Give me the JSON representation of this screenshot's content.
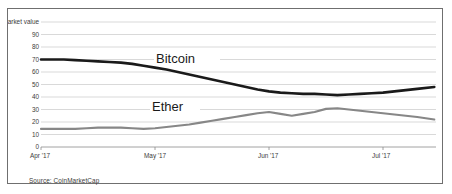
{
  "figure": {
    "source_note": "Source: CoinMarketCap"
  },
  "chart_data": {
    "type": "line",
    "title": "",
    "subtitle": "",
    "xlabel": "",
    "ylabel": "100% share of market value",
    "ylim": [
      0,
      100
    ],
    "yticks": [
      0,
      10,
      20,
      30,
      40,
      50,
      60,
      70,
      80,
      90
    ],
    "ytick_labels": [
      "0",
      "10",
      "20",
      "30",
      "40",
      "50",
      "60",
      "70",
      "80",
      "90"
    ],
    "ytop_label": "100% share of market value",
    "grid": true,
    "legend_position": "inline-annotation",
    "xticks": [
      0,
      1,
      2,
      3
    ],
    "xtick_labels": [
      "Apr '17",
      "May '17",
      "Jun '17",
      "Jul '17"
    ],
    "annotations": [
      {
        "text": "Bitcoin",
        "x": 1.45,
        "y": 60
      },
      {
        "text": "Ether",
        "x": 1.35,
        "y": 29
      }
    ],
    "series": [
      {
        "name": "Bitcoin",
        "color": "#1a1a1a",
        "x": [
          0.0,
          0.1,
          0.2,
          0.3,
          0.4,
          0.5,
          0.6,
          0.7,
          0.8,
          0.9,
          1.0,
          1.1,
          1.2,
          1.3,
          1.4,
          1.5,
          1.6,
          1.7,
          1.8,
          1.9,
          2.0,
          2.1,
          2.2,
          2.3,
          2.4,
          2.5,
          2.6,
          2.7,
          2.8,
          2.9,
          3.0,
          3.1,
          3.2,
          3.3,
          3.45
        ],
        "values": [
          70,
          70,
          70,
          69.5,
          69,
          68.5,
          68,
          67.5,
          66.5,
          65,
          63.5,
          62,
          60,
          58,
          56,
          54,
          52,
          50,
          48,
          46,
          44.5,
          43.5,
          43,
          42.5,
          42.5,
          42,
          41.5,
          42,
          42.5,
          43,
          43.5,
          44.5,
          45.5,
          46.5,
          48
        ]
      },
      {
        "name": "Ether",
        "color": "#878787",
        "x": [
          0.0,
          0.1,
          0.2,
          0.3,
          0.4,
          0.5,
          0.6,
          0.7,
          0.8,
          0.9,
          1.0,
          1.1,
          1.2,
          1.3,
          1.4,
          1.5,
          1.6,
          1.7,
          1.8,
          1.9,
          2.0,
          2.1,
          2.2,
          2.3,
          2.4,
          2.5,
          2.6,
          2.7,
          2.8,
          2.9,
          3.0,
          3.1,
          3.2,
          3.3,
          3.45
        ],
        "values": [
          14.5,
          14.5,
          14.5,
          14.5,
          15,
          15.5,
          15.5,
          15.5,
          15,
          14.5,
          15,
          16,
          17,
          18,
          19.5,
          21,
          22.5,
          24,
          25.5,
          27,
          28,
          26.5,
          25,
          26.5,
          28,
          30.5,
          31,
          30,
          29,
          28,
          27,
          26,
          25,
          24,
          22
        ]
      }
    ]
  }
}
